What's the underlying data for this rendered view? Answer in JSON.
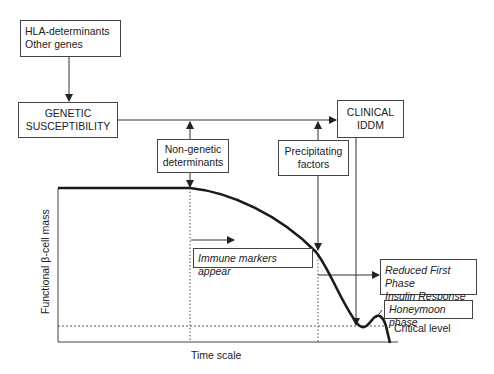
{
  "boxes": {
    "hla": {
      "line1": "HLA-determinants",
      "line2": "Other genes"
    },
    "genetic": {
      "line1": "GENETIC",
      "line2": "SUSCEPTIBILITY"
    },
    "non_genetic": {
      "line1": "Non-genetic",
      "line2": "determinants"
    },
    "precipitating": {
      "line1": "Precipitating",
      "line2": "factors"
    },
    "clinical": {
      "line1": "CLINICAL",
      "line2": "IDDM"
    },
    "immune": {
      "text": "Immune markers appear"
    },
    "reduced": {
      "line1": "Reduced First Phase",
      "line2": "Insulin Response"
    },
    "honeymoon": {
      "text": "Honeymoon phase"
    }
  },
  "axes": {
    "ylabel": "Functional β-cell mass",
    "xlabel": "Time scale",
    "critical_label": "Critical level"
  },
  "colors": {
    "line": "#222222",
    "box_border": "#444444"
  }
}
